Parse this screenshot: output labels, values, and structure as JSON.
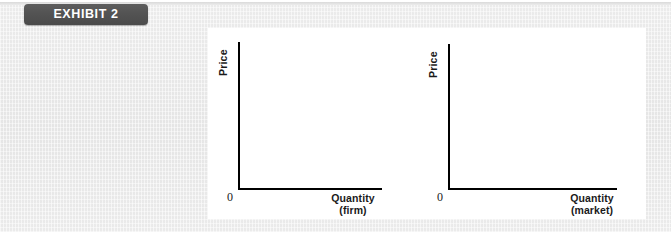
{
  "exhibit": {
    "badge_label": "EXHIBIT 2",
    "badge_color": "#535353",
    "badge_text_color": "#ffffff"
  },
  "panel": {
    "background": "#ffffff",
    "page_background": "#ececec"
  },
  "chart_data": [
    {
      "type": "line",
      "id": "firm",
      "title": "",
      "xlabel": "Quantity",
      "xlabel_line2": "(firm)",
      "ylabel": "Price",
      "origin_label": "0",
      "grid": false,
      "legend": "none",
      "axis_color": "#000000",
      "xlim": [
        0,
        100
      ],
      "ylim": [
        0,
        100
      ],
      "x": [],
      "series": [
        {
          "name": "",
          "values": []
        }
      ]
    },
    {
      "type": "line",
      "id": "market",
      "title": "",
      "xlabel": "Quantity",
      "xlabel_line2": "(market)",
      "ylabel": "Price",
      "origin_label": "0",
      "grid": false,
      "legend": "none",
      "axis_color": "#000000",
      "xlim": [
        0,
        100
      ],
      "ylim": [
        0,
        100
      ],
      "x": [],
      "series": [
        {
          "name": "",
          "values": []
        }
      ]
    }
  ]
}
